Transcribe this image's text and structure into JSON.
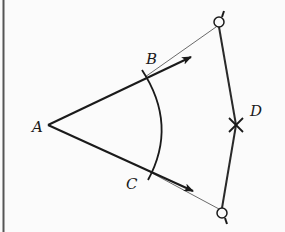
{
  "diagram": {
    "points": {
      "A": {
        "label": "A",
        "x": 48,
        "y": 125
      },
      "B": {
        "label": "B",
        "x": 145,
        "y": 77
      },
      "C": {
        "label": "C",
        "x": 150,
        "y": 172
      },
      "D": {
        "label": "D",
        "x": 236,
        "y": 125
      }
    },
    "labels": {
      "A": "A",
      "B": "B",
      "C": "C",
      "D": "D"
    },
    "colors": {
      "ink": "#1a1a1a",
      "thin_line": "#6a6a6a",
      "background": "#fbfbfb",
      "border": "#555555"
    }
  }
}
